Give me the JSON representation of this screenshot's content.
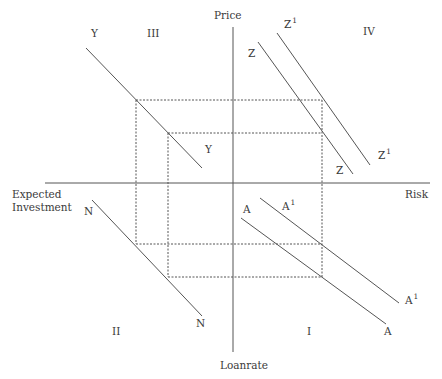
{
  "diagram": {
    "type": "four-quadrant diagram",
    "axes": {
      "top": "Price",
      "bottom": "Loanrate",
      "left_line1": "Expected",
      "left_line2": "Investment",
      "right": "Risk"
    },
    "quadrants": {
      "q1": "I",
      "q2": "II",
      "q3": "III",
      "q4": "IV"
    },
    "curves": {
      "Y": {
        "start_label": "Y",
        "end_label": "Y"
      },
      "N": {
        "start_label": "N",
        "end_label": "N"
      },
      "Z": {
        "start_label": "Z",
        "end_label": "Z"
      },
      "Z1": {
        "base": "Z",
        "sup": "1"
      },
      "A": {
        "start_label": "A",
        "end_label": "A"
      },
      "A1": {
        "base": "A",
        "sup": "1"
      }
    },
    "colors": {
      "line": "#555555",
      "text": "#3a3a3a",
      "background": "#ffffff"
    }
  }
}
